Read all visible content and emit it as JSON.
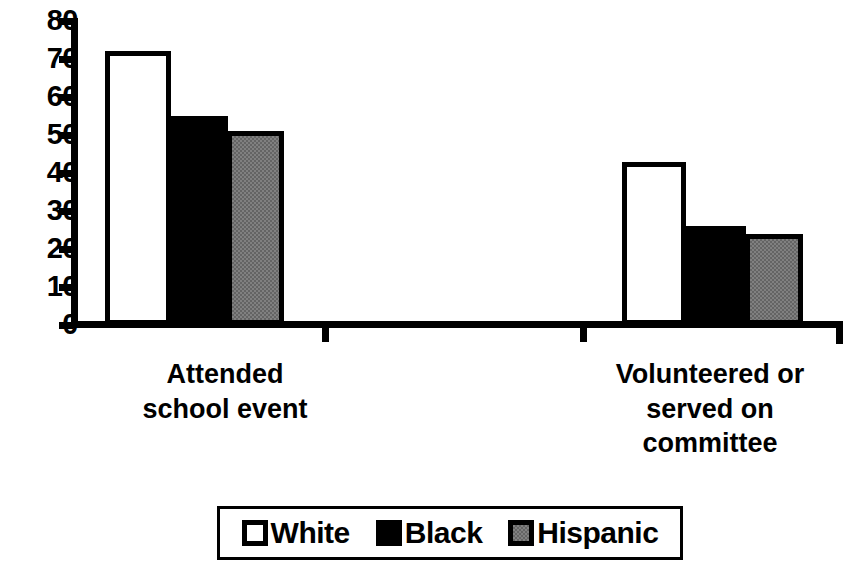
{
  "chart_data": {
    "type": "bar",
    "title": "",
    "subtitle": "",
    "xlabel": "",
    "ylabel": "",
    "ylim": [
      0,
      80
    ],
    "yticks": [
      0,
      10,
      20,
      30,
      40,
      50,
      60,
      70,
      80
    ],
    "ytick_labels": [
      "0",
      "10",
      "20",
      "30",
      "40",
      "50",
      "60",
      "70",
      "80"
    ],
    "grid": false,
    "legend_position": "bottom-center",
    "categories": [
      "Attended school event",
      "Volunteered or served on committee"
    ],
    "category_label_lines": [
      [
        "Attended",
        "school event"
      ],
      [
        "Volunteered or",
        "served on",
        "committee"
      ]
    ],
    "series": [
      {
        "name": "White",
        "color": "#ffffff",
        "values": [
          72,
          43
        ]
      },
      {
        "name": "Black",
        "color": "#000000",
        "values": [
          55,
          26
        ]
      },
      {
        "name": "Hispanic",
        "color": "#808080",
        "values": [
          51,
          24
        ]
      }
    ]
  },
  "legend": {
    "items": [
      {
        "label": "White",
        "swatch": "white"
      },
      {
        "label": "Black",
        "swatch": "black"
      },
      {
        "label": "Hispanic",
        "swatch": "gray"
      }
    ]
  },
  "colors": {
    "axis": "#000000",
    "background": "#ffffff",
    "white_series": "#ffffff",
    "black_series": "#000000",
    "hispanic_series": "#808080"
  }
}
